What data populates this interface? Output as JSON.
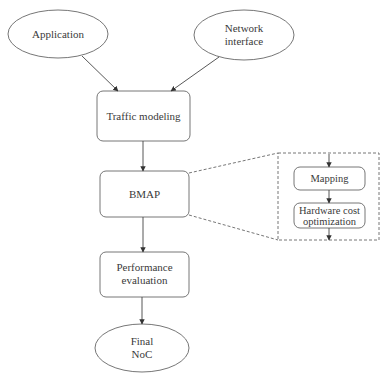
{
  "diagram": {
    "nodes": {
      "application": {
        "label": "Application",
        "shape": "ellipse"
      },
      "network_interface": {
        "line1": "Network",
        "line2": "interface",
        "shape": "ellipse"
      },
      "traffic_modeling": {
        "label": "Traffic modeling",
        "shape": "rounded-rect"
      },
      "bmap": {
        "label": "BMAP",
        "shape": "rounded-rect"
      },
      "performance_evaluation": {
        "line1": "Performance",
        "line2": "evaluation",
        "shape": "rounded-rect"
      },
      "final_noc": {
        "line1": "Final",
        "line2": "NoC",
        "shape": "ellipse"
      }
    },
    "bmap_detail": {
      "mapping": {
        "label": "Mapping"
      },
      "hardware_cost": {
        "line1": "Hardware cost",
        "line2": "optimization"
      }
    },
    "edges": [
      {
        "from": "Application",
        "to": "Traffic modeling"
      },
      {
        "from": "Network interface",
        "to": "Traffic modeling"
      },
      {
        "from": "Traffic modeling",
        "to": "BMAP"
      },
      {
        "from": "BMAP",
        "to": "Performance evaluation"
      },
      {
        "from": "Performance evaluation",
        "to": "Final NoC"
      },
      {
        "from": "Mapping",
        "to": "Hardware cost optimization"
      }
    ],
    "colors": {
      "stroke": "#555555",
      "text": "#3a3a3a",
      "background": "#ffffff"
    }
  }
}
